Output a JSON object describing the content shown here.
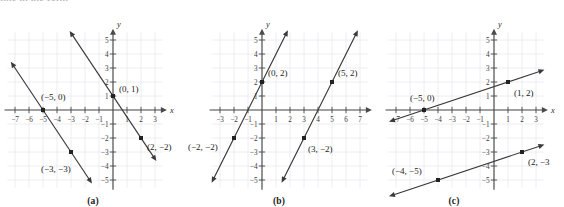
{
  "figure": {
    "cropped_header_text": "line in the form",
    "panels": [
      {
        "id": "a",
        "caption": "(a)",
        "axis_x_label": "x",
        "axis_y_label": "y",
        "x_ticks": [
          -7,
          -6,
          -5,
          -4,
          -3,
          -2,
          -1,
          1,
          2,
          3
        ],
        "y_ticks": [
          -5,
          -4,
          -3,
          -2,
          -1,
          1,
          2,
          3,
          4,
          5
        ],
        "x_tick_labels": [
          "−7",
          "−6",
          "−5",
          "−4",
          "−3",
          "−2",
          "−1",
          "1",
          "2",
          "3"
        ],
        "y_tick_labels": [
          "−5",
          "−4",
          "−3",
          "−2",
          "−1",
          "1",
          "2",
          "3",
          "4",
          "5"
        ],
        "point_labels": [
          {
            "text": "(0, 1)",
            "x": 0,
            "y": 1
          },
          {
            "text": "(2, −2)",
            "x": 2,
            "y": -2
          },
          {
            "text": "(−5, 0)",
            "x": -5,
            "y": 0
          },
          {
            "text": "(−3, −3)",
            "x": -3,
            "y": -3
          }
        ]
      },
      {
        "id": "b",
        "caption": "(b)",
        "axis_x_label": "x",
        "axis_y_label": "y",
        "x_ticks": [
          -3,
          -2,
          -1,
          1,
          2,
          3,
          4,
          5,
          6,
          7
        ],
        "y_ticks": [
          -5,
          -4,
          -3,
          -2,
          -1,
          1,
          2,
          3,
          4,
          5
        ],
        "x_tick_labels": [
          "−3",
          "−2",
          "−1",
          "1",
          "2",
          "3",
          "4",
          "5",
          "6",
          "7"
        ],
        "y_tick_labels": [
          "−5",
          "−4",
          "−3",
          "−2",
          "−1",
          "1",
          "2",
          "3",
          "4",
          "5"
        ],
        "point_labels": [
          {
            "text": "(0, 2)",
            "x": 0,
            "y": 2
          },
          {
            "text": "(5, 2)",
            "x": 5,
            "y": 2
          },
          {
            "text": "(−2, −2)",
            "x": -2,
            "y": -2
          },
          {
            "text": "(3, −2)",
            "x": 3,
            "y": -2
          }
        ]
      },
      {
        "id": "c",
        "caption": "(c)",
        "axis_x_label": "x",
        "axis_y_label": "y",
        "x_ticks": [
          -7,
          -6,
          -5,
          -4,
          -3,
          -2,
          -1,
          1,
          2,
          3
        ],
        "y_ticks": [
          -5,
          -4,
          -3,
          -2,
          -1,
          1,
          2,
          3,
          4,
          5
        ],
        "x_tick_labels": [
          "−7",
          "−6",
          "−5",
          "−4",
          "−3",
          "−2",
          "−1",
          "1",
          "2",
          "3"
        ],
        "y_tick_labels": [
          "−5",
          "−4",
          "−3",
          "−2",
          "−1",
          "1",
          "2",
          "3",
          "4",
          "5"
        ],
        "point_labels": [
          {
            "text": "(−5, 0)",
            "x": -5,
            "y": 0
          },
          {
            "text": "(1, 2)",
            "x": 1,
            "y": 2
          },
          {
            "text": "(−4, −5)",
            "x": -4,
            "y": -5
          },
          {
            "text": "(2, −3",
            "x": 2,
            "y": -3
          }
        ]
      }
    ]
  },
  "chart_data": [
    {
      "type": "line",
      "panel": "a",
      "title": "(a)",
      "xlabel": "x",
      "ylabel": "y",
      "xlim": [
        -7.8,
        3.8
      ],
      "ylim": [
        -5.8,
        5.8
      ],
      "grid": true,
      "series": [
        {
          "name": "line-a-left",
          "slope": -1.5,
          "intercept": -7.5,
          "points": [
            {
              "x": -5,
              "y": 0,
              "labeled": true
            },
            {
              "x": -3,
              "y": -3,
              "labeled": true
            }
          ],
          "endpoints": [
            {
              "x": -7.3,
              "y": 3.45
            },
            {
              "x": -1.5,
              "y": -5.25
            }
          ]
        },
        {
          "name": "line-a-right",
          "slope": -1.5,
          "intercept": 1,
          "points": [
            {
              "x": 0,
              "y": 1,
              "labeled": true
            },
            {
              "x": 2,
              "y": -2,
              "labeled": true
            }
          ],
          "endpoints": [
            {
              "x": -3.1,
              "y": 5.65
            },
            {
              "x": 3.1,
              "y": -3.65
            }
          ]
        }
      ]
    },
    {
      "type": "line",
      "panel": "b",
      "title": "(b)",
      "xlabel": "x",
      "ylabel": "y",
      "xlim": [
        -3.8,
        7.8
      ],
      "ylim": [
        -5.8,
        5.8
      ],
      "grid": true,
      "series": [
        {
          "name": "line-b-left",
          "slope": 2,
          "intercept": 2,
          "points": [
            {
              "x": 0,
              "y": 2,
              "labeled": true
            },
            {
              "x": -2,
              "y": -2,
              "labeled": true
            }
          ],
          "endpoints": [
            {
              "x": -3.6,
              "y": -5.2
            },
            {
              "x": 1.85,
              "y": 5.7
            }
          ]
        },
        {
          "name": "line-b-right",
          "slope": 2,
          "intercept": -8,
          "points": [
            {
              "x": 5,
              "y": 2,
              "labeled": true
            },
            {
              "x": 3,
              "y": -2,
              "labeled": true
            }
          ],
          "endpoints": [
            {
              "x": 1.4,
              "y": -5.2
            },
            {
              "x": 6.85,
              "y": 5.7
            }
          ]
        }
      ]
    },
    {
      "type": "line",
      "panel": "c",
      "title": "(c)",
      "xlabel": "x",
      "ylabel": "y",
      "xlim": [
        -7.8,
        3.8
      ],
      "ylim": [
        -5.8,
        5.8
      ],
      "grid": true,
      "series": [
        {
          "name": "line-c-upper",
          "slope": 0.3333,
          "intercept": 1.6667,
          "points": [
            {
              "x": -5,
              "y": 0,
              "labeled": true
            },
            {
              "x": 1,
              "y": 2,
              "labeled": true
            }
          ],
          "endpoints": [
            {
              "x": -7.5,
              "y": -0.833
            },
            {
              "x": 3.6,
              "y": 2.867
            }
          ]
        },
        {
          "name": "line-c-lower",
          "slope": 0.3333,
          "intercept": -3.6667,
          "points": [
            {
              "x": -4,
              "y": -5,
              "labeled": true
            },
            {
              "x": 2,
              "y": -3,
              "labeled": true
            }
          ],
          "endpoints": [
            {
              "x": -7.5,
              "y": -6.167
            },
            {
              "x": 3.6,
              "y": -2.467
            }
          ]
        }
      ]
    }
  ]
}
